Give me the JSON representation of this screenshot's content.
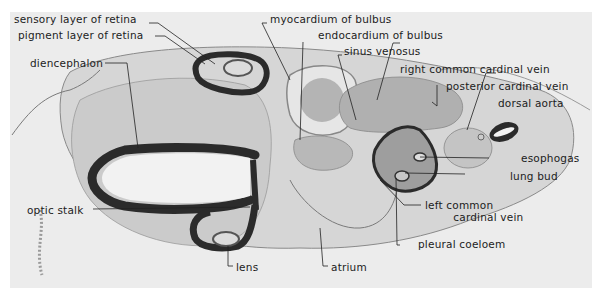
{
  "figure": {
    "colors": {
      "background": "#ffffff",
      "panel": "#ececec",
      "tissue_light": "#d2d2d2",
      "tissue_mid": "#a9a9a9",
      "epithelium_dark": "#2b2b2b",
      "label_text": "#1c1c1c"
    },
    "labels": {
      "sensory_layer_of_retina": "sensory layer of retina",
      "pigment_layer_of_retina": "pigment layer of retina",
      "diencephalon": "diencephalon",
      "optic_stalk": "optic stalk",
      "lens": "lens",
      "myocardium_of_bulbus": "myocardium of bulbus",
      "endocardium_of_bulbus": "endocardium of bulbus",
      "sinus_venosus": "sinus venosus",
      "atrium": "atrium",
      "right_common_cardinal_vein": "right  common cardinal vein",
      "posterior_cardinal_vein": "posterior cardinal vein",
      "dorsal_aorta": "dorsal aorta",
      "esophagus": "esophogas",
      "lung_bud": "lung bud",
      "left_common_cardinal_vein": "left common\n        cardinal vein",
      "pleural_coelom": "pleural coeloem"
    }
  }
}
